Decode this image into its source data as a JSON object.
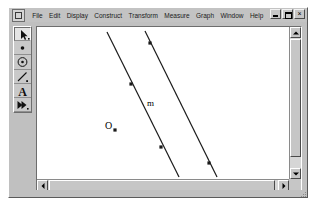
{
  "window": {
    "title": "",
    "controls": [
      {
        "name": "minimize",
        "glyph": "_"
      },
      {
        "name": "restore",
        "glyph": "❐"
      },
      {
        "name": "close",
        "glyph": "×"
      }
    ]
  },
  "menubar": {
    "app_icon": "sketchpad-app-icon",
    "items": [
      {
        "label": "File"
      },
      {
        "label": "Edit"
      },
      {
        "label": "Display"
      },
      {
        "label": "Construct"
      },
      {
        "label": "Transform"
      },
      {
        "label": "Measure"
      },
      {
        "label": "Graph"
      },
      {
        "label": "Window"
      },
      {
        "label": "Help"
      }
    ]
  },
  "toolbar": {
    "tools": [
      {
        "name": "selection-arrow-tool",
        "icon": "arrow-icon",
        "selected": true
      },
      {
        "name": "point-tool",
        "icon": "point-icon",
        "selected": false
      },
      {
        "name": "compass-tool",
        "icon": "circle-icon",
        "selected": false
      },
      {
        "name": "straightedge-tool",
        "icon": "line-segment-icon",
        "selected": false
      },
      {
        "name": "text-tool",
        "icon": "text-a-icon",
        "selected": false
      },
      {
        "name": "custom-tool",
        "icon": "double-arrow-icon",
        "selected": false
      }
    ]
  },
  "sketch": {
    "background": "#ffffff",
    "stroke_color": "#1a1a1a",
    "labels": [
      {
        "text": "m",
        "x": 146,
        "y": 98
      },
      {
        "text": "O",
        "x": 104,
        "y": 120
      }
    ],
    "lines": [
      {
        "name": "line-m",
        "x1": 106,
        "y1": 31,
        "x2": 178,
        "y2": 176
      },
      {
        "name": "line-parallel",
        "x1": 144,
        "y1": 30,
        "x2": 216,
        "y2": 176
      }
    ],
    "points": [
      {
        "name": "point-on-line-m-upper",
        "x": 130,
        "y": 83
      },
      {
        "name": "point-on-line-m-lower",
        "x": 160,
        "y": 146
      },
      {
        "name": "point-on-parallel-upper",
        "x": 149,
        "y": 42
      },
      {
        "name": "point-on-parallel-lower",
        "x": 208,
        "y": 162
      },
      {
        "name": "point-o",
        "x": 114,
        "y": 129
      }
    ]
  },
  "scrollbars": {
    "vertical": {
      "up": "scroll-up-arrow",
      "down": "scroll-down-arrow"
    },
    "horizontal": {
      "left": "scroll-left-arrow",
      "right": "scroll-right-arrow"
    }
  }
}
